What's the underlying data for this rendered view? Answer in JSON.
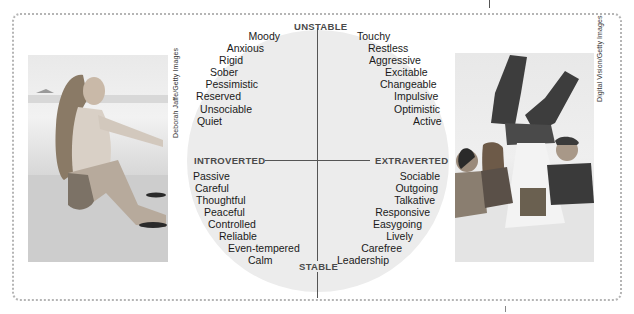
{
  "diagram": {
    "poles": {
      "top": "UNSTABLE",
      "bottom": "STABLE",
      "left": "INTROVERTED",
      "right": "EXTRAVERTED"
    },
    "quadrants": {
      "unstable_introverted": [
        "Moody",
        "Anxious",
        "Rigid",
        "Sober",
        "Pessimistic",
        "Reserved",
        "Unsociable",
        "Quiet"
      ],
      "unstable_extraverted": [
        "Touchy",
        "Restless",
        "Aggressive",
        "Excitable",
        "Changeable",
        "Impulsive",
        "Optimistic",
        "Active"
      ],
      "stable_introverted": [
        "Passive",
        "Careful",
        "Thoughtful",
        "Peaceful",
        "Controlled",
        "Reliable",
        "Even-tempered",
        "Calm"
      ],
      "stable_extraverted": [
        "Sociable",
        "Outgoing",
        "Talkative",
        "Responsive",
        "Easygoing",
        "Lively",
        "Carefree",
        "Leadership"
      ]
    },
    "photos": {
      "left": {
        "description": "woman sitting alone on beach",
        "credit": "Deborah Jaffe/Getty Images"
      },
      "right": {
        "description": "group of people watching person doing handstand on table",
        "credit": "Digital Vision/Getty Images"
      }
    },
    "colors": {
      "circle_fill": "#ececec",
      "axis_line": "#555555",
      "pole_text": "#4a4a4a",
      "frame_dots": "#b5b5b5"
    }
  }
}
